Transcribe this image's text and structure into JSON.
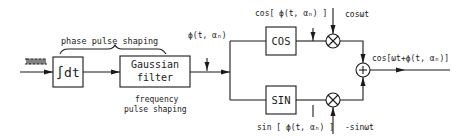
{
  "diagram": {
    "colors": {
      "line": "#1a1a1a",
      "background": "#ffffff"
    },
    "blocks": {
      "integrator": {
        "label": "∫dt"
      },
      "gaussian_filter": {
        "line1": "Gaussian",
        "line2": "filter"
      },
      "cos_block": {
        "label": "COS"
      },
      "sin_block": {
        "label": "SIN"
      },
      "multiplier_symbol": "⊗",
      "summer_symbol": "+"
    },
    "labels": {
      "phase_pulse_shaping": "phase pulse shaping",
      "frequency_pulse_shaping_1": "frequency",
      "frequency_pulse_shaping_2": "pulse shaping",
      "phase_signal": "ϕ(t, αₙ)",
      "cos_phase": "cos[ ϕ(t, αₙ) ]",
      "sin_phase": "sin [ ϕ(t, αₙ) ]",
      "carrier_cos": "cosωt",
      "carrier_sin": "-sinωt",
      "output": "cos[ωt+ϕ(t, αₙ)]"
    },
    "icons": {
      "input_bits": "square-wave-icon"
    }
  }
}
